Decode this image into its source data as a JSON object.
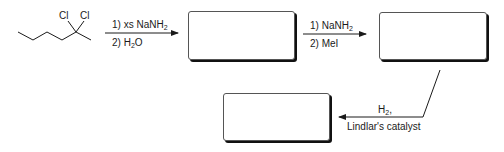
{
  "starting_material": {
    "name": "2,2-dichlorohexane",
    "substituents": [
      "Cl",
      "Cl"
    ]
  },
  "step1": {
    "reagent_line1_prefix": "1) xs NaNH",
    "reagent_line1_sub": "2",
    "reagent_line2_prefix": "2) H",
    "reagent_line2_sub": "2",
    "reagent_line2_suffix": "O"
  },
  "step2": {
    "reagent_line1_prefix": "1) NaNH",
    "reagent_line1_sub": "2",
    "reagent_line2": "2) MeI"
  },
  "step3": {
    "reagent_line1_prefix": "H",
    "reagent_line1_sub": "2",
    "reagent_line1_suffix": ",",
    "reagent_line2": "Lindlar's catalyst"
  },
  "answer_boxes": [
    "",
    "",
    ""
  ],
  "colors": {
    "ink": "#1a1a1a",
    "box_border": "#555555",
    "shadow": "#111111"
  }
}
